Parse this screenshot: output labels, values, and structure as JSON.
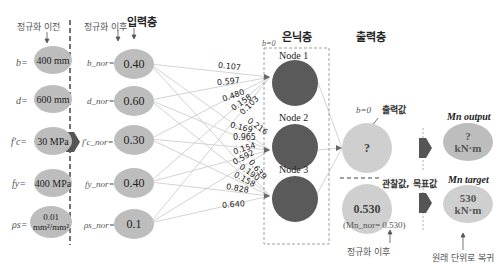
{
  "headers": {
    "before_norm": "정규화 이전",
    "after_norm": "정규화 이후",
    "input_layer": "입력층",
    "hidden_layer": "은닉층",
    "output_layer": "출력층"
  },
  "raw_inputs": [
    {
      "symbol": "b=",
      "value": "400 mm"
    },
    {
      "symbol": "d=",
      "value": "600 mm"
    },
    {
      "symbol": "f'c=",
      "value": "30 MPa"
    },
    {
      "symbol": "fy=",
      "value": "400 MPa"
    },
    {
      "symbol": "ρs=",
      "value": "0.01 mm²/mm²",
      "value_line1": "0.01",
      "value_line2": "mm²/mm²"
    }
  ],
  "normalized_inputs": [
    {
      "symbol": "b_nor=",
      "value": "0.40"
    },
    {
      "symbol": "d_nor=",
      "value": "0.60"
    },
    {
      "symbol": "f'c_nor=",
      "value": "0.30"
    },
    {
      "symbol": "fy_nor=",
      "value": "0.40"
    },
    {
      "symbol": "ρs_nor=",
      "value": "0.1"
    }
  ],
  "hidden": {
    "bias_label": "b=0",
    "nodes": [
      {
        "label": "Node 1"
      },
      {
        "label": "Node 2"
      },
      {
        "label": "Node 3"
      }
    ]
  },
  "weights": {
    "node1": [
      "0.107",
      "0.597",
      "0.480",
      "0.158",
      "0.103"
    ],
    "node2": [
      "0.216",
      "0.169",
      "0.965",
      "0.154",
      "0.592"
    ],
    "node3": [
      "0.639",
      "0.190",
      "0.158",
      "0.828",
      "0.640"
    ]
  },
  "output": {
    "bias_label": "b=0",
    "output_value_label": "출력값",
    "output_node_value": "?",
    "observed_label": "관찰값, 목표값",
    "target_node_value": "0.530",
    "target_norm_caption": "(Mn_nor= 0.530)",
    "after_norm_caption": "정규화 이후",
    "mn_output_title": "Mn output",
    "mn_output_value": "?",
    "mn_output_unit": "kN·m",
    "mn_target_title": "Mn target",
    "mn_target_value": "530",
    "mn_target_unit": "kN·m",
    "restore_caption": "원래 단위로 복귀"
  },
  "colors": {
    "input_oval": "#bdbdbd",
    "hidden_node": "#5a5a5a",
    "output_node": "#cfcfcf",
    "arrow": "#666666"
  }
}
